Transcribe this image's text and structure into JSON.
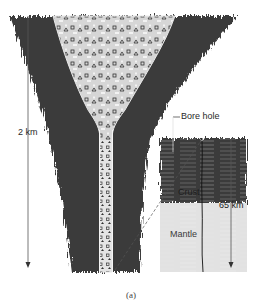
{
  "figure": {
    "caption": "(a)",
    "labels": {
      "left_depth": "2 km",
      "bore_hole": "Bore hole",
      "crust": "Crust",
      "mantle": "Mantle",
      "right_depth": "65 km"
    },
    "colors": {
      "rock_dark": "#3a3a3a",
      "pipe_fill": "#d6d6d6",
      "mantle_fill": "#e2e2e2",
      "line": "#555555"
    }
  }
}
